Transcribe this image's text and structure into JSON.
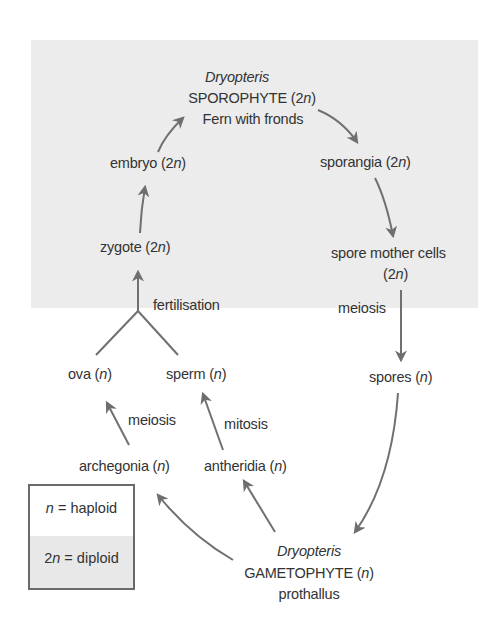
{
  "diagram": {
    "title_genus": "Dryopteris",
    "sporophyte": {
      "genus": "Dryopteris",
      "name": "SPOROPHYTE",
      "ploidy": "(2n)",
      "description": "Fern with fronds"
    },
    "gametophyte": {
      "genus": "Dryopteris",
      "name": "GAMETOPHYTE",
      "ploidy": "(n)",
      "description": "prothallus"
    },
    "nodes": {
      "sporangia": {
        "label": "sporangia",
        "ploidy": "(2n)"
      },
      "spore_mother_cells": {
        "label": "spore mother cells",
        "ploidy": "(2n)"
      },
      "spores": {
        "label": "spores",
        "ploidy": "(n)"
      },
      "archegonia": {
        "label": "archegonia",
        "ploidy": "(n)"
      },
      "antheridia": {
        "label": "antheridia",
        "ploidy": "(n)"
      },
      "ova": {
        "label": "ova",
        "ploidy": "(n)"
      },
      "sperm": {
        "label": "sperm",
        "ploidy": "(n)"
      },
      "zygote": {
        "label": "zygote",
        "ploidy": "(2n)"
      },
      "embryo": {
        "label": "embryo",
        "ploidy": "(2n)"
      }
    },
    "process_labels": {
      "meiosis_spores": "meiosis",
      "meiosis_ova": "meiosis",
      "mitosis_sperm": "mitosis",
      "fertilisation": "fertilisation"
    },
    "legend": {
      "haploid_symbol": "n",
      "haploid_text": " = haploid",
      "diploid_symbol_num": "2",
      "diploid_symbol_n": "n",
      "diploid_text": " = diploid"
    },
    "colors": {
      "diploid_background": "#ececec",
      "haploid_background": "#ffffff",
      "arrow": "#6e6e6e",
      "text": "#333333",
      "legend_border": "#6a6a6a"
    }
  }
}
